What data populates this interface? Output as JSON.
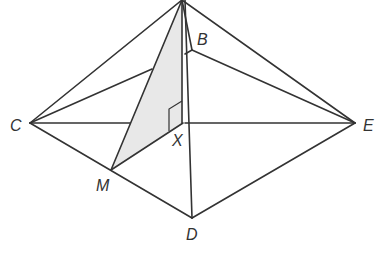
{
  "figure": {
    "shade_color": "#e8e8e8",
    "line_color": "#333333",
    "points": {
      "A": {
        "x": 182,
        "y": 0
      },
      "B": {
        "x": 192,
        "y": 50
      },
      "C": {
        "x": 30,
        "y": 123
      },
      "D": {
        "x": 192,
        "y": 218
      },
      "E": {
        "x": 355,
        "y": 123
      },
      "X": {
        "x": 183,
        "y": 123
      },
      "M": {
        "x": 111,
        "y": 170
      }
    },
    "labels": {
      "B": "B",
      "C": "C",
      "D": "D",
      "E": "E",
      "X": "X",
      "M": "M"
    },
    "right_angle_marker": "at X between AX and XM",
    "shaded_triangle": [
      "A",
      "M",
      "X"
    ]
  }
}
